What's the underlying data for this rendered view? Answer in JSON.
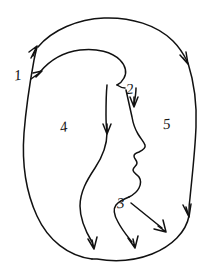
{
  "figure": {
    "background_color": "#ffffff",
    "stroke_color": "#111111",
    "label_color": "#151515",
    "width": 215,
    "height": 274
  },
  "labels": [
    {
      "text": "1",
      "x": 14,
      "y": 68,
      "size": 15,
      "rotate": -8,
      "name": "label-1"
    },
    {
      "text": "2",
      "x": 126,
      "y": 82,
      "size": 15,
      "rotate": -6,
      "name": "label-2"
    },
    {
      "text": "3",
      "x": 117,
      "y": 196,
      "size": 15,
      "rotate": -4,
      "name": "label-3"
    },
    {
      "text": "4",
      "x": 60,
      "y": 120,
      "size": 15,
      "rotate": -10,
      "name": "label-4"
    },
    {
      "text": "5",
      "x": 163,
      "y": 117,
      "size": 15,
      "rotate": -6,
      "name": "label-5"
    }
  ],
  "regions": [
    {
      "id": "4",
      "description": "left interior region beside the profile"
    },
    {
      "id": "5",
      "description": "right interior region beside the profile"
    }
  ],
  "contours": [
    {
      "id": "1",
      "description": "outer oval left side, arrowheads pointing up-right"
    },
    {
      "id": "2",
      "description": "hairline into forehead, arrow pointing down"
    },
    {
      "id": "3",
      "description": "chin and jaw, arrow pointing down-right"
    }
  ],
  "arrow_count": 9
}
